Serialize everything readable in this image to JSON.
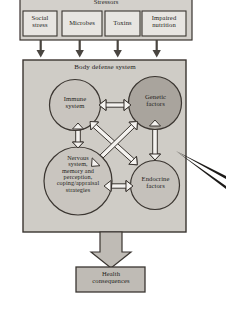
{
  "diagram": {
    "colors": {
      "box_fill": "#d3d0cb",
      "inner_box_fill": "#cfccc6",
      "circle_light": "#c9c5bf",
      "circle_dark": "#a9a49d",
      "arrow_fill": "#f2f0ed",
      "stroke": "#3a3530",
      "text": "#241f1c"
    },
    "stressors": {
      "group_label": "Stressors",
      "items": [
        {
          "id": "social-stress",
          "label": "Social\nstress"
        },
        {
          "id": "microbes",
          "label": "Microbes"
        },
        {
          "id": "toxins",
          "label": "Toxins"
        },
        {
          "id": "impaired-nutrition",
          "label": "Impaired\nnutrition"
        }
      ]
    },
    "body_defense": {
      "group_label": "Body defense system",
      "nodes": [
        {
          "id": "immune-system",
          "label": "Immune\nsystem",
          "shade": "light"
        },
        {
          "id": "genetic-factors",
          "label": "Genetic\nfactors",
          "shade": "dark"
        },
        {
          "id": "nervous-system",
          "label": "Nervous\nsystem,\nmemory and\nperception,\ncoping/appraisal\nstrategies",
          "shade": "light"
        },
        {
          "id": "endocrine-factors",
          "label": "Endocrine\nfactors",
          "shade": "light"
        }
      ],
      "connections": [
        {
          "from": "immune-system",
          "to": "genetic-factors",
          "style": "double-headed-block-arrow"
        },
        {
          "from": "immune-system",
          "to": "nervous-system",
          "style": "double-headed-block-arrow"
        },
        {
          "from": "immune-system",
          "to": "endocrine-factors",
          "style": "double-headed-block-arrow"
        },
        {
          "from": "genetic-factors",
          "to": "nervous-system",
          "style": "double-headed-block-arrow"
        },
        {
          "from": "genetic-factors",
          "to": "endocrine-factors",
          "style": "double-headed-block-arrow"
        },
        {
          "from": "nervous-system",
          "to": "endocrine-factors",
          "style": "double-headed-block-arrow"
        }
      ]
    },
    "outcome": {
      "id": "health-consequences",
      "label": "Health\nconsequences"
    },
    "flow_arrows": {
      "stressors_to_defense_count": 4,
      "defense_to_outcome": "thick-block-arrow-down"
    },
    "callout": {
      "id": "pointer-annotation",
      "style": "thin-wedge-pointer-from-right"
    }
  }
}
